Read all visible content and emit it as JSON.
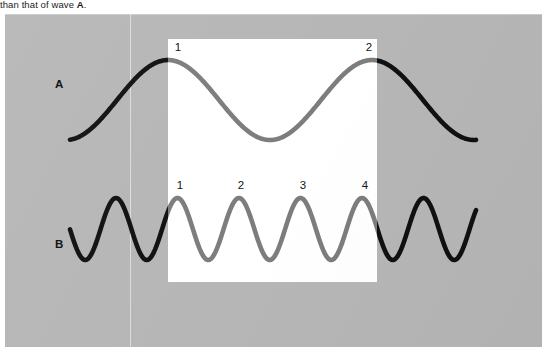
{
  "figure": {
    "caption_prefix": "than that of wave ",
    "caption_bold": "A",
    "caption_suffix": ".",
    "background_color": "#ffffff",
    "plate_color": "#b6b6b6",
    "highlight_color": "#ffffff",
    "wave_outside_color": "#101010",
    "wave_inside_color": "#7d7d7d"
  },
  "rows": [
    {
      "label": "A",
      "label_x": 50,
      "label_y": 64,
      "crest_numbers": [
        "1",
        "2"
      ],
      "crest_positions": [
        {
          "label": "1",
          "x": 170,
          "y": 41
        },
        {
          "label": "2",
          "x": 361,
          "y": 41
        }
      ]
    },
    {
      "label": "B",
      "label_x": 50,
      "label_y": 224,
      "crest_numbers": [
        "1",
        "2",
        "3",
        "4"
      ],
      "crest_positions": [
        {
          "label": "1",
          "x": 172,
          "y": 179
        },
        {
          "label": "2",
          "x": 233,
          "y": 179
        },
        {
          "label": "3",
          "x": 295,
          "y": 179
        },
        {
          "label": "4",
          "x": 357,
          "y": 179
        }
      ]
    }
  ],
  "chart_data": {
    "type": "line",
    "title": "",
    "xlabel": "",
    "ylabel": "",
    "grid": false,
    "legend": "none",
    "xlim": [
      70,
      475
    ],
    "ylim": [
      39,
      282
    ],
    "annotations": [
      "Wave A completes 2 crests within the highlighted window",
      "Wave B completes 4 crests within the highlighted window"
    ],
    "highlight_window": {
      "x0": 168,
      "x1": 377,
      "y0": 39,
      "y1": 282
    },
    "series": [
      {
        "name": "A",
        "waveform": "sine",
        "baseline_y": 100,
        "amplitude": 40,
        "period_px": 204,
        "peak_y": 60,
        "trough_y": 140,
        "x_start": 70,
        "x_end": 476,
        "crest_x": [
          168,
          372
        ],
        "crests_in_window": 2,
        "stroke_width": 4.6
      },
      {
        "name": "B",
        "waveform": "sine",
        "baseline_y": 229,
        "amplitude": 31,
        "period_px": 61.5,
        "peak_y": 198,
        "trough_y": 260,
        "x_start": 70,
        "x_end": 476,
        "crest_x": [
          116,
          177.5,
          239,
          300.5,
          362,
          423.5
        ],
        "crests_in_window": 4,
        "stroke_width": 4.6
      }
    ]
  }
}
